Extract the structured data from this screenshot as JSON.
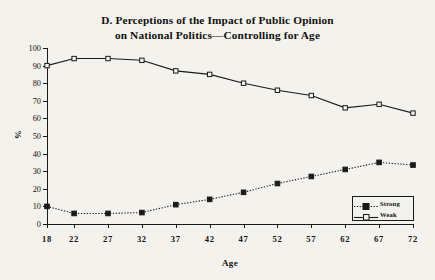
{
  "chart_data": {
    "type": "line",
    "title": "D. Perceptions of the Impact of Public Opinion on National Politics—Controlling for Age",
    "title_line1": "D. Perceptions of the Impact of Public Opinion",
    "title_line2": "on National Politics—Controlling for Age",
    "xlabel": "Age",
    "ylabel": "%",
    "x": [
      18,
      22,
      27,
      32,
      37,
      42,
      47,
      52,
      57,
      62,
      67,
      72
    ],
    "xtick_labels": [
      "18",
      "22",
      "27",
      "32",
      "37",
      "42",
      "47",
      "52",
      "57",
      "62",
      "67",
      "72"
    ],
    "ytick_labels": [
      "0",
      "10",
      "20",
      "30",
      "40",
      "50",
      "60",
      "70",
      "80",
      "90",
      "100"
    ],
    "ytick_values": [
      0,
      10,
      20,
      30,
      40,
      50,
      60,
      70,
      80,
      90,
      100
    ],
    "xlim": [
      18,
      72
    ],
    "ylim": [
      0,
      100
    ],
    "grid": false,
    "legend_position": "bottom-right",
    "series": [
      {
        "name": "Strong",
        "marker": "filled-square",
        "line_style": "dotted",
        "color": "#1a1a1a",
        "values": [
          10,
          6,
          6,
          6.5,
          11,
          14,
          18,
          23,
          27,
          31,
          35,
          33.5
        ]
      },
      {
        "name": "Weak",
        "marker": "open-square",
        "line_style": "solid",
        "color": "#1a1a1a",
        "values": [
          90,
          94,
          94,
          93,
          87,
          85,
          80,
          76,
          73,
          66,
          68,
          63
        ]
      }
    ]
  },
  "legend": {
    "entries": [
      {
        "label": "Strong"
      },
      {
        "label": "Weak"
      }
    ]
  },
  "colors": {
    "background": "#f4f2ec",
    "ink": "#1a1a1a"
  }
}
